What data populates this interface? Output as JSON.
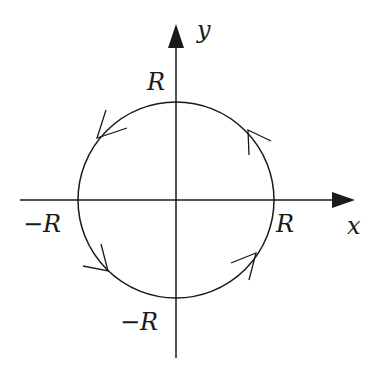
{
  "diagram": {
    "type": "contour-circle",
    "axes": {
      "x_label": "x",
      "y_label": "y"
    },
    "ticks": {
      "x_pos": "R",
      "x_neg": "−R",
      "y_pos": "R",
      "y_neg": "−R"
    },
    "circle": {
      "direction": "counterclockwise",
      "radius_label": "R"
    },
    "colors": {
      "stroke": "#1a1a1a",
      "background": "#ffffff"
    }
  }
}
